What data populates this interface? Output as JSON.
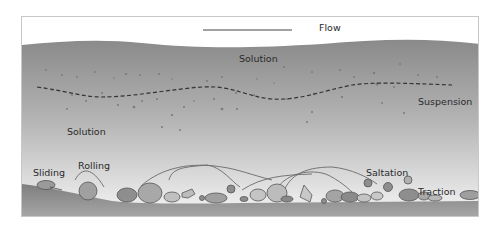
{
  "diagram": {
    "flow_label": "Flow",
    "labels": {
      "solution_top": "Solution",
      "suspension": "Suspension",
      "solution_left": "Solution",
      "sliding": "Sliding",
      "rolling": "Rolling",
      "saltation": "Saltation",
      "traction": "Traction"
    },
    "colors": {
      "water_top": "#8a8a8a",
      "water_bottom": "#f2f2f2",
      "bed": "#8c8c8c",
      "pebble": "#9a9a9a",
      "pebble_light": "#bdbdbd",
      "outline": "#555555",
      "dashed_line": "#333333"
    }
  }
}
